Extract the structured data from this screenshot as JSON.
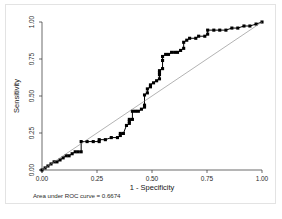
{
  "figure": {
    "background_color": "#ffffff",
    "frame_color": "#e3e3e3",
    "auc_note": "Area under ROC curve = 0.6674"
  },
  "chart_data": {
    "type": "line",
    "title": "",
    "subtitle": "",
    "xlabel": "1 - Specificity",
    "ylabel": "Sensitivity",
    "xlim": [
      0.0,
      1.0
    ],
    "ylim": [
      0.0,
      1.0
    ],
    "grid": false,
    "legend": null,
    "legend_position": "none",
    "annotations": [
      {
        "text": "Area under ROC curve = 0.6674",
        "position": "below-axis-left"
      }
    ],
    "xticks": [
      0.0,
      0.25,
      0.5,
      0.75,
      1.0
    ],
    "xtick_labels": [
      "0.00",
      "0.25",
      "0.50",
      "0.75",
      "1.00"
    ],
    "yticks": [
      0.0,
      0.25,
      0.5,
      0.75,
      1.0
    ],
    "ytick_labels": [
      "0.00",
      "0.25",
      "0.50",
      "0.75",
      "1.00"
    ],
    "auc": 0.6674,
    "series": [
      {
        "name": "ROC curve",
        "color": "#000000",
        "marker": "square",
        "marker_size": 3.1,
        "line_width": 1.0,
        "step": true,
        "points": [
          [
            0.0,
            0.0
          ],
          [
            0.014,
            0.014
          ],
          [
            0.027,
            0.027
          ],
          [
            0.041,
            0.041
          ],
          [
            0.055,
            0.055
          ],
          [
            0.068,
            0.055
          ],
          [
            0.082,
            0.068
          ],
          [
            0.096,
            0.082
          ],
          [
            0.11,
            0.096
          ],
          [
            0.123,
            0.096
          ],
          [
            0.137,
            0.11
          ],
          [
            0.151,
            0.123
          ],
          [
            0.164,
            0.123
          ],
          [
            0.178,
            0.123
          ],
          [
            0.178,
            0.192
          ],
          [
            0.205,
            0.192
          ],
          [
            0.233,
            0.192
          ],
          [
            0.26,
            0.192
          ],
          [
            0.26,
            0.205
          ],
          [
            0.288,
            0.205
          ],
          [
            0.315,
            0.219
          ],
          [
            0.343,
            0.219
          ],
          [
            0.356,
            0.233
          ],
          [
            0.356,
            0.247
          ],
          [
            0.37,
            0.247
          ],
          [
            0.384,
            0.301
          ],
          [
            0.397,
            0.315
          ],
          [
            0.397,
            0.329
          ],
          [
            0.397,
            0.342
          ],
          [
            0.411,
            0.342
          ],
          [
            0.411,
            0.397
          ],
          [
            0.425,
            0.397
          ],
          [
            0.438,
            0.397
          ],
          [
            0.452,
            0.411
          ],
          [
            0.466,
            0.425
          ],
          [
            0.466,
            0.438
          ],
          [
            0.466,
            0.507
          ],
          [
            0.479,
            0.521
          ],
          [
            0.479,
            0.548
          ],
          [
            0.493,
            0.562
          ],
          [
            0.493,
            0.575
          ],
          [
            0.507,
            0.589
          ],
          [
            0.521,
            0.603
          ],
          [
            0.534,
            0.616
          ],
          [
            0.534,
            0.644
          ],
          [
            0.534,
            0.658
          ],
          [
            0.534,
            0.671
          ],
          [
            0.548,
            0.685
          ],
          [
            0.548,
            0.74
          ],
          [
            0.548,
            0.767
          ],
          [
            0.562,
            0.781
          ],
          [
            0.575,
            0.781
          ],
          [
            0.589,
            0.795
          ],
          [
            0.603,
            0.795
          ],
          [
            0.616,
            0.795
          ],
          [
            0.63,
            0.808
          ],
          [
            0.644,
            0.822
          ],
          [
            0.644,
            0.863
          ],
          [
            0.658,
            0.877
          ],
          [
            0.671,
            0.89
          ],
          [
            0.699,
            0.89
          ],
          [
            0.712,
            0.904
          ],
          [
            0.74,
            0.904
          ],
          [
            0.753,
            0.918
          ],
          [
            0.753,
            0.945
          ],
          [
            0.781,
            0.945
          ],
          [
            0.808,
            0.945
          ],
          [
            0.836,
            0.945
          ],
          [
            0.863,
            0.959
          ],
          [
            0.89,
            0.959
          ],
          [
            0.918,
            0.973
          ],
          [
            0.945,
            0.973
          ],
          [
            0.973,
            0.986
          ],
          [
            1.0,
            1.0
          ]
        ]
      },
      {
        "name": "Reference line",
        "color": "#808080",
        "marker": "none",
        "marker_size": 0,
        "line_width": 0.6,
        "step": false,
        "points": [
          [
            0.0,
            0.0
          ],
          [
            1.0,
            1.0
          ]
        ]
      }
    ]
  }
}
